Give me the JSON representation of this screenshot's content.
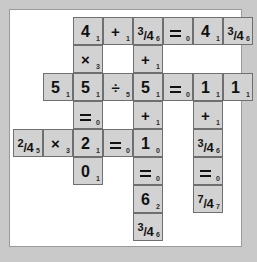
{
  "puzzle": {
    "type": "arithmetic-crossword-grid",
    "rows": 8,
    "cols": 7,
    "cell_width": 30,
    "cell_height": 28,
    "origin_x": 33,
    "origin_y": 7,
    "colors": {
      "page_background": "#c9c9c9",
      "paper_background": "#ffffff",
      "paper_border": "#9a9a9a",
      "cell_fill": "#d2d2d2",
      "cell_border": "#6f6f6f",
      "glyph": "#111111",
      "subscript": "#2b2b2b"
    },
    "cells": [
      {
        "row": 0,
        "col": 1,
        "kind": "digit",
        "main": "4",
        "sub": "1"
      },
      {
        "row": 0,
        "col": 2,
        "kind": "operator",
        "main": "+",
        "sub": "1"
      },
      {
        "row": 0,
        "col": 3,
        "kind": "fraction",
        "num": "3",
        "den": "4",
        "main": "3/4",
        "sub": "6"
      },
      {
        "row": 0,
        "col": 4,
        "kind": "equals",
        "main": "=",
        "sub": "0"
      },
      {
        "row": 0,
        "col": 5,
        "kind": "digit",
        "main": "4",
        "sub": "1"
      },
      {
        "row": 0,
        "col": 6,
        "kind": "fraction",
        "num": "3",
        "den": "4",
        "main": "3/4",
        "sub": "6"
      },
      {
        "row": 1,
        "col": 1,
        "kind": "operator",
        "main": "×",
        "sub": "3"
      },
      {
        "row": 1,
        "col": 3,
        "kind": "operator",
        "main": "+",
        "sub": "1"
      },
      {
        "row": 2,
        "col": 0,
        "kind": "digit",
        "main": "5",
        "sub": "1"
      },
      {
        "row": 2,
        "col": 1,
        "kind": "digit",
        "main": "5",
        "sub": "1"
      },
      {
        "row": 2,
        "col": 2,
        "kind": "operator",
        "main": "÷",
        "sub": "5"
      },
      {
        "row": 2,
        "col": 3,
        "kind": "digit",
        "main": "5",
        "sub": "1"
      },
      {
        "row": 2,
        "col": 4,
        "kind": "equals",
        "main": "=",
        "sub": "0"
      },
      {
        "row": 2,
        "col": 5,
        "kind": "digit",
        "main": "1",
        "sub": "1"
      },
      {
        "row": 2,
        "col": 6,
        "kind": "digit",
        "main": "1",
        "sub": "1"
      },
      {
        "row": 3,
        "col": 1,
        "kind": "equals",
        "main": "=",
        "sub": "0"
      },
      {
        "row": 3,
        "col": 3,
        "kind": "operator",
        "main": "+",
        "sub": "1"
      },
      {
        "row": 3,
        "col": 5,
        "kind": "operator",
        "main": "+",
        "sub": "1"
      },
      {
        "row": 4,
        "col": -1,
        "kind": "fraction",
        "num": "2",
        "den": "4",
        "main": "2/4",
        "sub": "5"
      },
      {
        "row": 4,
        "col": 0,
        "kind": "operator",
        "main": "×",
        "sub": "3"
      },
      {
        "row": 4,
        "col": 1,
        "kind": "digit",
        "main": "2",
        "sub": "1"
      },
      {
        "row": 4,
        "col": 2,
        "kind": "equals",
        "main": "=",
        "sub": "0"
      },
      {
        "row": 4,
        "col": 3,
        "kind": "digit",
        "main": "1",
        "sub": "0"
      },
      {
        "row": 4,
        "col": 5,
        "kind": "fraction",
        "num": "3",
        "den": "4",
        "main": "3/4",
        "sub": "6"
      },
      {
        "row": 5,
        "col": 1,
        "kind": "digit",
        "main": "0",
        "sub": "1"
      },
      {
        "row": 5,
        "col": 3,
        "kind": "equals",
        "main": "=",
        "sub": "0"
      },
      {
        "row": 5,
        "col": 5,
        "kind": "equals",
        "main": "=",
        "sub": "0"
      },
      {
        "row": 6,
        "col": 3,
        "kind": "digit",
        "main": "6",
        "sub": "2"
      },
      {
        "row": 6,
        "col": 5,
        "kind": "fraction",
        "num": "7",
        "den": "4",
        "main": "7/4",
        "sub": "7"
      },
      {
        "row": 7,
        "col": 3,
        "kind": "fraction",
        "num": "3",
        "den": "4",
        "main": "3/4",
        "sub": "6"
      }
    ]
  }
}
